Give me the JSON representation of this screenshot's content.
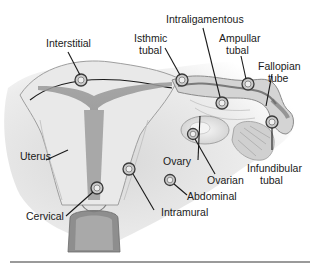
{
  "figure": {
    "type": "anatomical-diagram"
  },
  "labels": {
    "interstitial": "Interstitial",
    "isthmic": [
      "Isthmic",
      "tubal"
    ],
    "intraligamentous": "Intraligamentous",
    "ampullar": [
      "Ampullar",
      "tubal"
    ],
    "fallopian": [
      "Fallopian",
      "tube"
    ],
    "uterus": "Uterus",
    "ovary": "Ovary",
    "ovarian": "Ovarian",
    "infundibular": [
      "Infundibular",
      "tubal"
    ],
    "abdominal": "Abdominal",
    "intramural": "Intramural",
    "cervical": "Cervical"
  },
  "colors": {
    "tissue_light": "#e6e6e6",
    "tissue_mid": "#c4c4c4",
    "tissue_dark": "#8a8a8a",
    "text": "#1a1a1a",
    "rule": "#9a9a9a"
  }
}
